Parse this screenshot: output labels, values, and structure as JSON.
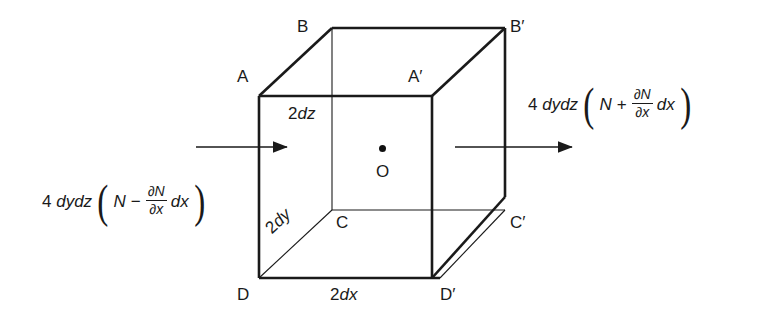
{
  "figure": {
    "background_color": "#ffffff",
    "line_color": "#1a1a1a",
    "text_color": "#1a1a1a",
    "vertices": [
      {
        "name": "A",
        "label": "A",
        "x": 259,
        "y": 96,
        "label_x": 237,
        "label_y": 68
      },
      {
        "name": "B",
        "label": "B",
        "x": 332,
        "y": 28,
        "label_x": 297,
        "label_y": 18
      },
      {
        "name": "Ap",
        "label": "A′",
        "x": 432,
        "y": 96,
        "label_x": 408,
        "label_y": 68
      },
      {
        "name": "Bp",
        "label": "B′",
        "x": 505,
        "y": 28,
        "label_x": 510,
        "label_y": 18
      },
      {
        "name": "C",
        "label": "C",
        "x": 332,
        "y": 210,
        "label_x": 336,
        "label_y": 214
      },
      {
        "name": "Cp",
        "label": "C′",
        "x": 505,
        "y": 197,
        "label_x": 510,
        "label_y": 214
      },
      {
        "name": "D",
        "label": "D",
        "x": 259,
        "y": 278,
        "label_x": 237,
        "label_y": 286
      },
      {
        "name": "Dp",
        "label": "D′",
        "x": 440,
        "y": 278,
        "label_x": 440,
        "label_y": 286
      }
    ],
    "center_point": {
      "label": "O",
      "dot_x": 382,
      "dot_y": 148,
      "label_x": 376,
      "label_y": 163
    },
    "dimensions": [
      {
        "name": "height-2dz",
        "num": "2",
        "sym": "dz",
        "x": 288,
        "y": 105
      },
      {
        "name": "depth-2dy",
        "num": "2",
        "sym": "dy",
        "x": 271,
        "y": 222,
        "rotation": -43
      },
      {
        "name": "width-2dx",
        "num": "2",
        "sym": "dx",
        "x": 330,
        "y": 286
      }
    ]
  },
  "flux_in": {
    "name": "incoming-flux",
    "coef_lead": "4",
    "coef_sym": "dydz",
    "open_paren": "(",
    "close_paren": ")",
    "base_var": "N",
    "operator": "−",
    "numerator": "∂N",
    "denominator": "∂x",
    "differential": "dx"
  },
  "flux_out": {
    "name": "outgoing-flux",
    "coef_lead": "4",
    "coef_sym": "dydz",
    "open_paren": "(",
    "close_paren": ")",
    "base_var": "N",
    "operator": "+",
    "numerator": "∂N",
    "denominator": "∂x",
    "differential": "dx"
  },
  "arrows": {
    "left": {
      "x1": 196,
      "y1": 147,
      "x2": 287,
      "y2": 147
    },
    "right": {
      "x1": 455,
      "y1": 147,
      "x2": 572,
      "y2": 147
    }
  }
}
